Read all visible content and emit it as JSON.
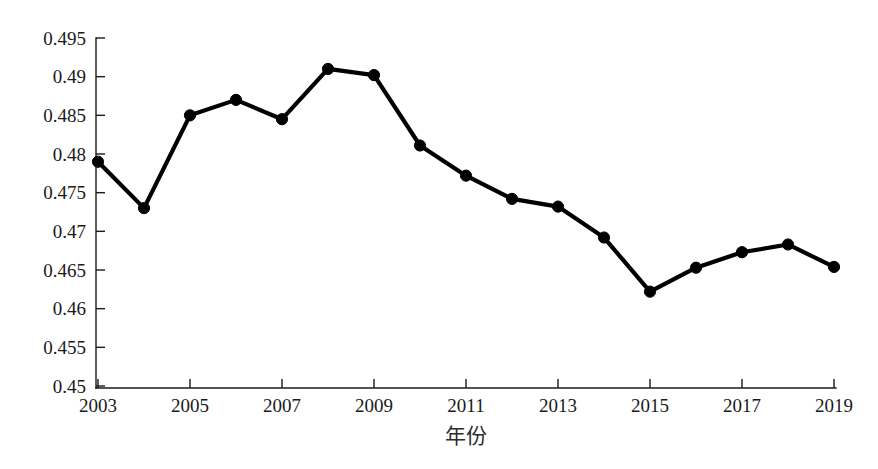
{
  "chart_data": {
    "type": "line",
    "title": "",
    "subtitle": "",
    "xlabel": "年份",
    "ylabel": "",
    "grid": false,
    "legend": null,
    "x": [
      2003,
      2004,
      2005,
      2006,
      2007,
      2008,
      2009,
      2010,
      2011,
      2012,
      2013,
      2014,
      2015,
      2016,
      2017,
      2018,
      2019
    ],
    "values": [
      0.479,
      0.473,
      0.485,
      0.487,
      0.4845,
      0.491,
      0.4902,
      0.4811,
      0.4772,
      0.4742,
      0.4732,
      0.4692,
      0.4622,
      0.4653,
      0.4673,
      0.4683,
      0.4654
    ],
    "series": [
      {
        "name": "series-1",
        "color": "#000000",
        "marker": "circle",
        "values": [
          0.479,
          0.473,
          0.485,
          0.487,
          0.4845,
          0.491,
          0.4902,
          0.4811,
          0.4772,
          0.4742,
          0.4732,
          0.4692,
          0.4622,
          0.4653,
          0.4673,
          0.4683,
          0.4654
        ]
      }
    ],
    "xlim": [
      2003,
      2019
    ],
    "ylim": [
      0.45,
      0.495
    ],
    "y_ticks": [
      0.45,
      0.455,
      0.46,
      0.465,
      0.47,
      0.475,
      0.48,
      0.485,
      0.49,
      0.495
    ],
    "y_tick_labels": [
      "0.45",
      "0.455",
      "0.46",
      "0.465",
      "0.47",
      "0.475",
      "0.48",
      "0.485",
      "0.49",
      "0.495"
    ],
    "x_ticks": [
      2003,
      2005,
      2007,
      2009,
      2011,
      2013,
      2015,
      2017,
      2019
    ],
    "x_tick_labels": [
      "2003",
      "2005",
      "2007",
      "2009",
      "2011",
      "2013",
      "2015",
      "2017",
      "2019"
    ],
    "axis_color": "#1a1a1a"
  }
}
